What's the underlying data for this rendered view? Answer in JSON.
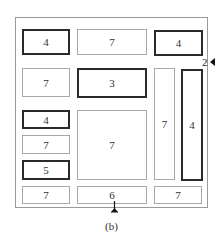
{
  "caption": "(b)",
  "side_label": "2",
  "boxes": [
    {
      "id": "r1c1",
      "label": "4",
      "style": "thick",
      "x": 22,
      "y": 29,
      "w": 48,
      "h": 26
    },
    {
      "id": "r1c2",
      "label": "7",
      "style": "thin",
      "x": 77,
      "y": 29,
      "w": 70,
      "h": 26
    },
    {
      "id": "r1c3",
      "label": "4",
      "style": "thick",
      "x": 154,
      "y": 30,
      "w": 49,
      "h": 26
    },
    {
      "id": "r2c1",
      "label": "7",
      "style": "thin",
      "x": 22,
      "y": 68,
      "w": 48,
      "h": 29
    },
    {
      "id": "r2c2",
      "label": "3",
      "style": "thick",
      "x": 77,
      "y": 68,
      "w": 70,
      "h": 30
    },
    {
      "id": "tall7",
      "label": "7",
      "style": "thin",
      "x": 154,
      "y": 68,
      "w": 21,
      "h": 112
    },
    {
      "id": "tall4",
      "label": "4",
      "style": "thick",
      "x": 181,
      "y": 69,
      "w": 22,
      "h": 112
    },
    {
      "id": "r3c1",
      "label": "4",
      "style": "thick",
      "x": 22,
      "y": 110,
      "w": 48,
      "h": 19
    },
    {
      "id": "big7",
      "label": "7",
      "style": "thin",
      "x": 77,
      "y": 110,
      "w": 70,
      "h": 70
    },
    {
      "id": "r4c1",
      "label": "7",
      "style": "thin",
      "x": 22,
      "y": 135,
      "w": 48,
      "h": 19
    },
    {
      "id": "r5c1",
      "label": "5",
      "style": "thick",
      "x": 22,
      "y": 160,
      "w": 48,
      "h": 20
    },
    {
      "id": "b1",
      "label": "7",
      "style": "thin",
      "x": 22,
      "y": 186,
      "w": 48,
      "h": 18
    },
    {
      "id": "b2",
      "label": "6",
      "style": "thin",
      "x": 77,
      "y": 186,
      "w": 70,
      "h": 18
    },
    {
      "id": "b3",
      "label": "7",
      "style": "thin",
      "x": 154,
      "y": 186,
      "w": 48,
      "h": 18
    }
  ]
}
